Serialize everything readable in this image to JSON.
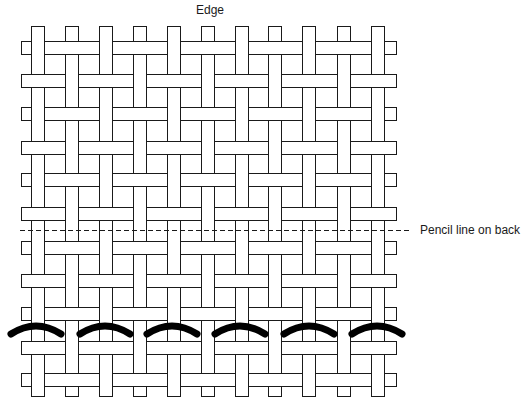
{
  "labels": {
    "top": "Edge",
    "pencil_line": "Pencil line on back"
  },
  "colors": {
    "stroke": "#1a1a1a",
    "fill": "#ffffff",
    "stitch": "#000000"
  },
  "weave": {
    "type": "plain weave",
    "vertical_strips": {
      "count": 11,
      "x_positions": [
        31,
        65,
        99,
        133,
        167,
        201,
        235,
        268,
        302,
        337,
        371
      ],
      "width": 13,
      "top": 26,
      "bottom": 396
    },
    "horizontal_strips": {
      "count": 11,
      "y_positions": [
        41,
        74,
        107,
        141,
        173,
        207,
        241,
        274,
        307,
        341,
        373
      ],
      "height": 13,
      "left": 21,
      "right": 396
    }
  },
  "pencil_line": {
    "x1": 20,
    "x2": 410,
    "y": 230,
    "style": "dashed"
  },
  "stitches": {
    "count": 6,
    "stroke_width": 7,
    "arcs": [
      {
        "x1": 11,
        "x2": 61,
        "y_end": 334,
        "y_peak": 327
      },
      {
        "x1": 80,
        "x2": 130,
        "y_end": 334,
        "y_peak": 327
      },
      {
        "x1": 147,
        "x2": 197,
        "y_end": 334,
        "y_peak": 327
      },
      {
        "x1": 215,
        "x2": 265,
        "y_end": 334,
        "y_peak": 327
      },
      {
        "x1": 284,
        "x2": 334,
        "y_end": 334,
        "y_peak": 327
      },
      {
        "x1": 352,
        "x2": 402,
        "y_end": 334,
        "y_peak": 327
      }
    ]
  }
}
